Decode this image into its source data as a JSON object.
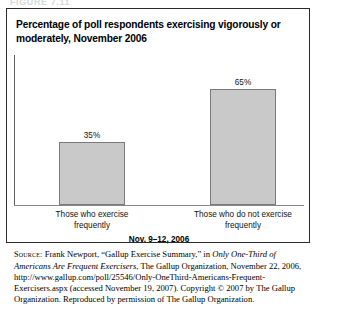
{
  "figure_caption": "FIGURE 7.11",
  "chart": {
    "title": "Percentage of poll respondents exercising vigorously or moderately, November 2006",
    "axis_title": "Nov. 9–12, 2006"
  },
  "chart_data": {
    "type": "bar",
    "title": "Percentage of poll respondents exercising vigorously or moderately, November 2006",
    "categories": [
      "Those who exercise frequently",
      "Those who do not exercise frequently"
    ],
    "values": [
      35,
      65
    ],
    "value_labels": [
      "35%",
      "65%"
    ],
    "xlabel": "Nov. 9–12, 2006",
    "ylabel": "",
    "ylim": [
      0,
      100
    ],
    "grid": false,
    "legend": false,
    "bar_color": "#c9c9c9",
    "bar_border_color": "#7a7a7a"
  },
  "source": {
    "label": "Source:",
    "text_1": " Frank Newport, “Gallup Exercise Summary,” in ",
    "italic_title": "Only One-Third of Americans Are Frequent Exercisers",
    "text_2": ", The Gallup Organization, November 22, 2006, http://www.gallup.com/poll/25546/Only-OneThird-Americans-Frequent-Exercisers.aspx (accessed November 19, 2007). Copyright © 2007 by The Gallup Organization. Reproduced by permission of The Gallup Organization."
  }
}
